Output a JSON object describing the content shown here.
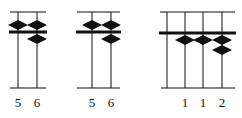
{
  "figure": {
    "abacuses": [
      {
        "id": "abacus-1",
        "frame": {
          "left": 10,
          "right": 46
        },
        "rods": [
          {
            "x": 18,
            "label": "5",
            "upper_beads_down": 1,
            "lower_beads_up": 0
          },
          {
            "x": 37,
            "label": "6",
            "upper_beads_down": 1,
            "lower_beads_up": 1
          }
        ]
      },
      {
        "id": "abacus-2",
        "frame": {
          "left": 77,
          "right": 121
        },
        "rods": [
          {
            "x": 92,
            "label": "5",
            "upper_beads_down": 1,
            "lower_beads_up": 0
          },
          {
            "x": 111,
            "label": "6",
            "upper_beads_down": 1,
            "lower_beads_up": 1
          }
        ]
      },
      {
        "id": "abacus-3",
        "frame": {
          "left": 160,
          "right": 235
        },
        "rods": [
          {
            "x": 167,
            "label": "",
            "upper_beads_down": 0,
            "lower_beads_up": 0
          },
          {
            "x": 185,
            "label": "1",
            "upper_beads_down": 0,
            "lower_beads_up": 1
          },
          {
            "x": 203,
            "label": "1",
            "upper_beads_down": 0,
            "lower_beads_up": 1
          },
          {
            "x": 222,
            "label": "2",
            "upper_beads_down": 0,
            "lower_beads_up": 2
          }
        ]
      }
    ],
    "labels": {
      "a1_r1": "5",
      "a1_r2": "6",
      "a2_r1": "5",
      "a2_r2": "6",
      "a3_r2": "1",
      "a3_r3": "1",
      "a3_r4": "2"
    }
  }
}
